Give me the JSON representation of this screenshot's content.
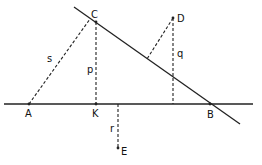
{
  "diagram": {
    "type": "geometry",
    "colors": {
      "line": "#222222",
      "text": "#111111",
      "background": "#ffffff"
    },
    "points": {
      "A": {
        "label": "A",
        "x": 29,
        "y": 104
      },
      "K": {
        "label": "K",
        "x": 96,
        "y": 104
      },
      "B": {
        "label": "B",
        "x": 210,
        "y": 104
      },
      "C": {
        "label": "C",
        "x": 96,
        "y": 22
      },
      "D": {
        "label": "D",
        "x": 173,
        "y": 18
      },
      "E": {
        "label": "E",
        "x": 118,
        "y": 148
      }
    },
    "segment_labels": {
      "s": "s",
      "p": "p",
      "q": "q",
      "r": "r"
    }
  }
}
